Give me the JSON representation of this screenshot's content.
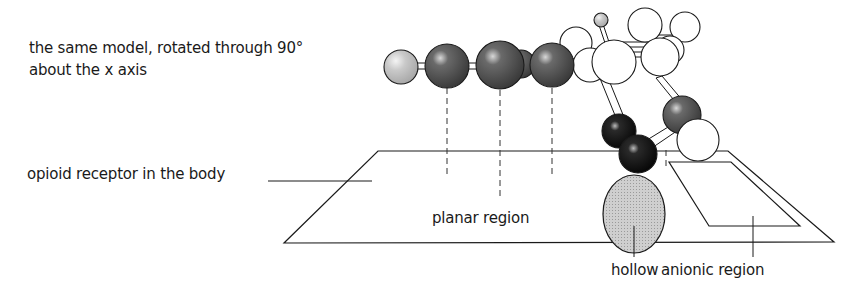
{
  "figure": {
    "caption_line1": "the same model, rotated through 90°",
    "caption_line2": "about the x axis",
    "labels": {
      "receptor": "opioid receptor in the body",
      "planar_region": "planar region",
      "hollow": "hollow",
      "anionic_region": "anionic region"
    },
    "colors": {
      "line": "#1a1a1a",
      "dark_atom": "#4a4a4a",
      "light_grey_atom": "#c8c8c8",
      "black_atom": "#0d0d0d",
      "white_atom": "#ffffff",
      "hollow_fill": "#c4c4c4"
    }
  }
}
